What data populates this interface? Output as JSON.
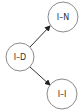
{
  "diagram": {
    "nodes": [
      {
        "id": "ID",
        "label": "I–D",
        "cx": 20,
        "cy": 57,
        "r": 14
      },
      {
        "id": "IN",
        "label": "I–N",
        "cx": 63,
        "cy": 17,
        "r": 15
      },
      {
        "id": "II",
        "label": "I–I",
        "cx": 62,
        "cy": 94,
        "r": 15
      }
    ],
    "edges": [
      {
        "from": "ID",
        "to": "IN",
        "x1": 30,
        "y1": 47,
        "x2": 50,
        "y2": 26
      },
      {
        "from": "ID",
        "to": "II",
        "x1": 30,
        "y1": 67,
        "x2": 50,
        "y2": 85
      }
    ],
    "colors": {
      "node_stroke": "#8a8a8a",
      "edge": "#333333",
      "text": "#333333"
    }
  }
}
